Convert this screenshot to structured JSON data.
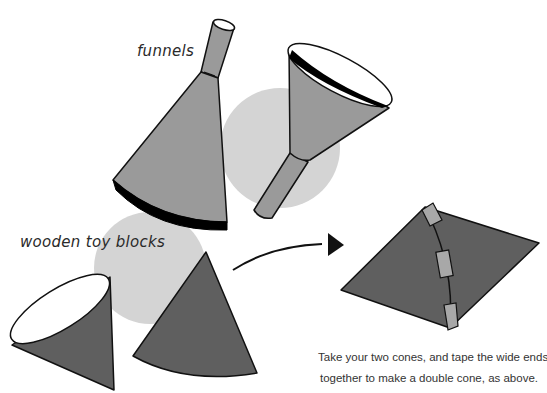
{
  "labels": {
    "funnels": "funnels",
    "blocks": "wooden toy blocks"
  },
  "caption": {
    "line1": "Take your two cones, and tape the wide ends",
    "line2": "together to make a double cone, as above."
  },
  "figures": [
    {
      "name": "funnel-1",
      "type": "funnel",
      "label_ref": "funnels"
    },
    {
      "name": "funnel-2",
      "type": "funnel",
      "label_ref": "funnels"
    },
    {
      "name": "wooden-cone-open",
      "type": "cone",
      "label_ref": "blocks"
    },
    {
      "name": "wooden-cone-closed",
      "type": "cone",
      "label_ref": "blocks"
    },
    {
      "name": "arrow",
      "type": "arrow"
    },
    {
      "name": "double-cone",
      "type": "double-cone",
      "tape_pieces": 3
    }
  ],
  "colors": {
    "funnel_fill": "#9a9a9a",
    "cone_fill": "#5f5f5f",
    "shadow": "#d2d2d2",
    "tape": "#a8a8a8",
    "outline": "#111111",
    "rim": "#000000",
    "background": "#ffffff"
  }
}
